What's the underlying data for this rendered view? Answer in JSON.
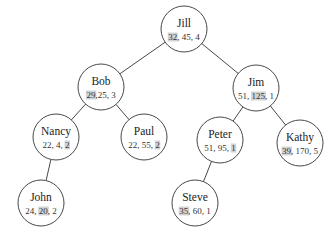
{
  "diagram": {
    "type": "binary-tree",
    "highlight_color": "#d4d4d4",
    "nodes": [
      {
        "id": "jill",
        "name": "Jill",
        "values": [
          "32",
          "45",
          "4"
        ],
        "highlight": 0,
        "cx": 184,
        "cy": 29
      },
      {
        "id": "bob",
        "name": "Bob",
        "values": [
          "29",
          "25",
          "3"
        ],
        "highlight": 0,
        "cx": 101,
        "cy": 87,
        "compact": true
      },
      {
        "id": "jim",
        "name": "Jim",
        "values": [
          "51",
          "125",
          "1"
        ],
        "highlight": 1,
        "cx": 256,
        "cy": 88
      },
      {
        "id": "nancy",
        "name": "Nancy",
        "values": [
          "22",
          "4",
          "2"
        ],
        "highlight": 2,
        "cx": 56,
        "cy": 137
      },
      {
        "id": "paul",
        "name": "Paul",
        "values": [
          "22",
          "55",
          "2"
        ],
        "highlight": 2,
        "cx": 144,
        "cy": 137
      },
      {
        "id": "peter",
        "name": "Peter",
        "values": [
          "51",
          "95",
          "1"
        ],
        "highlight": 2,
        "cx": 220,
        "cy": 140
      },
      {
        "id": "kathy",
        "name": "Kathy",
        "values": [
          "39",
          "170",
          "5"
        ],
        "highlight": 0,
        "cx": 300,
        "cy": 143
      },
      {
        "id": "john",
        "name": "John",
        "values": [
          "24",
          "20",
          "2"
        ],
        "highlight": 1,
        "cx": 41,
        "cy": 203
      },
      {
        "id": "steve",
        "name": "Steve",
        "values": [
          "35",
          "60",
          "1"
        ],
        "highlight": 0,
        "cx": 195,
        "cy": 203
      }
    ],
    "edges": [
      [
        "jill",
        "bob"
      ],
      [
        "jill",
        "jim"
      ],
      [
        "bob",
        "nancy"
      ],
      [
        "bob",
        "paul"
      ],
      [
        "jim",
        "peter"
      ],
      [
        "jim",
        "kathy"
      ],
      [
        "nancy",
        "john"
      ],
      [
        "peter",
        "steve"
      ]
    ]
  }
}
